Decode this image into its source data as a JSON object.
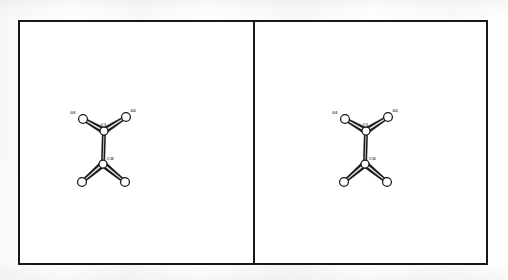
{
  "figure": {
    "kind": "crystallographic-stereo-pair",
    "panel_count": 2,
    "background_color": "#ffffff",
    "line_color": "#18181b",
    "frame": {
      "x": 18,
      "y": 20,
      "width": 470,
      "height": 245,
      "border_px": 2
    },
    "divider": {
      "x": 255,
      "width": 2
    }
  },
  "structure": {
    "name": "oxalate-type fragment",
    "atom_labels": [
      "O1",
      "C1",
      "O2",
      "C1I"
    ],
    "atoms": [
      {
        "id": "O1",
        "label": "O1",
        "element": "O",
        "x": 63,
        "y": 97,
        "r": 4.4,
        "label_dx": -7.5,
        "label_dy": -5.5,
        "labeled": true
      },
      {
        "id": "O2",
        "label": "O2",
        "element": "O",
        "x": 106,
        "y": 95,
        "r": 4.4,
        "label_dx": 4.5,
        "label_dy": -5.5,
        "labeled": true
      },
      {
        "id": "C1",
        "label": "C1",
        "element": "C",
        "x": 84,
        "y": 109,
        "r": 4.0,
        "label_dx": -0.5,
        "label_dy": -5.5,
        "labeled": true
      },
      {
        "id": "C1I",
        "label": "C1I",
        "element": "C",
        "x": 83,
        "y": 142,
        "r": 4.0,
        "label_dx": 4.0,
        "label_dy": -4.0,
        "labeled": true
      },
      {
        "id": "O1I",
        "label": "",
        "element": "O",
        "x": 62,
        "y": 160,
        "r": 4.4,
        "label_dx": 0,
        "label_dy": 0,
        "labeled": false
      },
      {
        "id": "O2I",
        "label": "",
        "element": "O",
        "x": 105,
        "y": 160,
        "r": 4.4,
        "label_dx": 0,
        "label_dy": 0,
        "labeled": false
      }
    ],
    "bonds": [
      {
        "from": "O1",
        "to": "C1",
        "w_from": 1.6,
        "w_to": 3.2
      },
      {
        "from": "O2",
        "to": "C1",
        "w_from": 1.6,
        "w_to": 3.2
      },
      {
        "from": "C1",
        "to": "C1I",
        "w_from": 1.7,
        "w_to": 1.7
      },
      {
        "from": "C1I",
        "to": "O1I",
        "w_from": 3.2,
        "w_to": 1.6
      },
      {
        "from": "C1I",
        "to": "O2I",
        "w_from": 3.2,
        "w_to": 1.6
      }
    ]
  },
  "panels": [
    {
      "id": "panel-left",
      "name": "left-eye-view",
      "offset_x": 0.0
    },
    {
      "id": "panel-right",
      "name": "right-eye-view",
      "offset_x": 27.0
    }
  ]
}
